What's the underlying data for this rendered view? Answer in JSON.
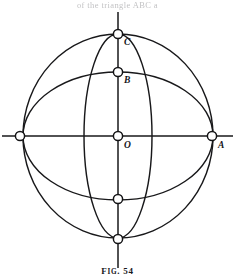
{
  "figure": {
    "caption_prefix": "F",
    "caption_smallcaps": "IG",
    "caption_number": ". 54",
    "caption_full": "Fig. 54",
    "top_partial_text": "of                    the  triangle ABC  a",
    "stroke_color": "#18181a",
    "background_color": "#ffffff",
    "marker_fill": "#ffffff"
  },
  "geometry": {
    "center": {
      "x": 118,
      "y": 136
    },
    "outer_circle": {
      "cx": 118,
      "cy": 136,
      "rx": 95,
      "ry": 102
    },
    "horizontal_ellipse": {
      "cx": 118,
      "cy": 136,
      "rx": 95,
      "ry": 64
    },
    "vertical_ellipse": {
      "cx": 118,
      "cy": 136,
      "rx": 34,
      "ry": 102
    },
    "horizontal_axis": {
      "x1": 2,
      "y1": 136,
      "x2": 233,
      "y2": 136
    },
    "vertical_axis": {
      "x1": 118,
      "y1": 12,
      "x2": 118,
      "y2": 268
    }
  },
  "points": [
    {
      "id": "C",
      "label": "C",
      "x": 118,
      "y": 34,
      "label_x": 124,
      "label_y": 38,
      "labeled": true
    },
    {
      "id": "B",
      "label": "B",
      "x": 118,
      "y": 72,
      "label_x": 124,
      "label_y": 76,
      "labeled": true
    },
    {
      "id": "O",
      "label": "O",
      "x": 118,
      "y": 136,
      "label_x": 124,
      "label_y": 141,
      "labeled": true
    },
    {
      "id": "A",
      "label": "A",
      "x": 212,
      "y": 136,
      "label_x": 218,
      "label_y": 141,
      "labeled": true
    },
    {
      "id": "left-node",
      "label": "",
      "x": 20,
      "y": 136,
      "label_x": 0,
      "label_y": 0,
      "labeled": false
    },
    {
      "id": "lower-node",
      "label": "",
      "x": 118,
      "y": 199,
      "label_x": 0,
      "label_y": 0,
      "labeled": false
    },
    {
      "id": "bottom-node",
      "label": "",
      "x": 118,
      "y": 239,
      "label_x": 0,
      "label_y": 0,
      "labeled": false
    }
  ],
  "marker_radius": 4.6
}
